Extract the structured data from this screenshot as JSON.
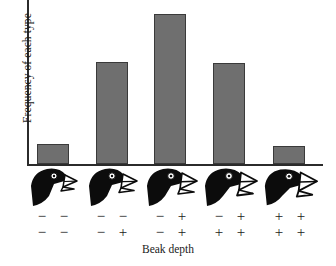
{
  "chart_data": {
    "type": "bar",
    "title": "",
    "xlabel": "Beak depth",
    "ylabel": "Frequency of each type",
    "grid": false,
    "legend": "none",
    "ylim": [
      0,
      120
    ],
    "categories": [
      "-- / --",
      "-- / -+",
      "-+ / -+",
      "-+ / ++",
      "++ / ++"
    ],
    "values": [
      15,
      75,
      110,
      74,
      13
    ],
    "bar_color": "#6f6f6f",
    "bar_border_color": "#3a3a3a",
    "axis_color": "#2b2b2b",
    "annotations": [
      "Five beak-depth genotype classes shown as finch head silhouettes",
      "Beak depth increases left to right with number of + alleles"
    ]
  },
  "axes": {
    "y_title": "Frequency of each type",
    "x_title": "Beak depth"
  },
  "columns": [
    {
      "id": "col-1",
      "bar_value": 15,
      "beak_depth_rank": 1,
      "bird_icon": "finch-head-icon",
      "genotype_top": "− −",
      "genotype_bottom": "− −"
    },
    {
      "id": "col-2",
      "bar_value": 75,
      "beak_depth_rank": 2,
      "bird_icon": "finch-head-icon",
      "genotype_top": "− −",
      "genotype_bottom": "− +"
    },
    {
      "id": "col-3",
      "bar_value": 110,
      "beak_depth_rank": 3,
      "bird_icon": "finch-head-icon",
      "genotype_top": "− +",
      "genotype_bottom": "− +"
    },
    {
      "id": "col-4",
      "bar_value": 74,
      "beak_depth_rank": 4,
      "bird_icon": "finch-head-icon",
      "genotype_top": "− +",
      "genotype_bottom": "+ +"
    },
    {
      "id": "col-5",
      "bar_value": 13,
      "beak_depth_rank": 5,
      "bird_icon": "finch-head-icon",
      "genotype_top": "+ +",
      "genotype_bottom": "+ +"
    }
  ]
}
